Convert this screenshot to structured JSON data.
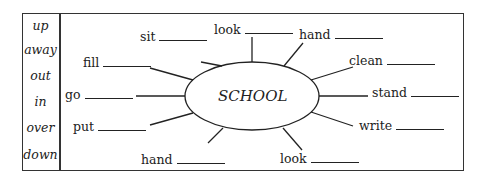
{
  "particles": [
    "up",
    "away",
    "out",
    "in",
    "over",
    "down"
  ],
  "center": "SCHOOL",
  "verbs": [
    {
      "label": "sit"
    },
    {
      "label": "look"
    },
    {
      "label": "hand"
    },
    {
      "label": "fill"
    },
    {
      "label": "clean"
    },
    {
      "label": "go"
    },
    {
      "label": "stand"
    },
    {
      "label": "put"
    },
    {
      "label": "write"
    },
    {
      "label": "hand"
    },
    {
      "label": "look"
    }
  ]
}
